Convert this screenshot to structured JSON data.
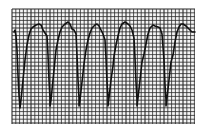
{
  "image": {
    "description": "ECG rhythm strip on grid paper showing wide-complex, sine-wave-like beats",
    "background_color": "#ffffff",
    "grid_color": "#2a2a2a",
    "trace_color": "#111111",
    "grid": {
      "x0": 12,
      "y0": 9,
      "x1": 195,
      "y1": 124,
      "minor": 3.8,
      "major": 19
    },
    "trace_points": [
      [
        14,
        32
      ],
      [
        15,
        30
      ],
      [
        16,
        36
      ],
      [
        17,
        50
      ],
      [
        18,
        75
      ],
      [
        19,
        95
      ],
      [
        20,
        108
      ],
      [
        21,
        100
      ],
      [
        23,
        80
      ],
      [
        25,
        60
      ],
      [
        27,
        45
      ],
      [
        29,
        35
      ],
      [
        31,
        29
      ],
      [
        33,
        27
      ],
      [
        36,
        25
      ],
      [
        39,
        24
      ],
      [
        41,
        25
      ],
      [
        43,
        30
      ],
      [
        45,
        33
      ],
      [
        47,
        36
      ],
      [
        48,
        55
      ],
      [
        49,
        80
      ],
      [
        50,
        98
      ],
      [
        50,
        106
      ],
      [
        51,
        100
      ],
      [
        53,
        80
      ],
      [
        55,
        60
      ],
      [
        56,
        50
      ],
      [
        58,
        40
      ],
      [
        60,
        32
      ],
      [
        62,
        27
      ],
      [
        65,
        24
      ],
      [
        68,
        22
      ],
      [
        70,
        24
      ],
      [
        72,
        29
      ],
      [
        74,
        30
      ],
      [
        76,
        34
      ],
      [
        77,
        55
      ],
      [
        78,
        80
      ],
      [
        79,
        98
      ],
      [
        79,
        106
      ],
      [
        80,
        100
      ],
      [
        82,
        82
      ],
      [
        84,
        64
      ],
      [
        86,
        50
      ],
      [
        88,
        40
      ],
      [
        90,
        33
      ],
      [
        92,
        28
      ],
      [
        95,
        25
      ],
      [
        97,
        24
      ],
      [
        99,
        26
      ],
      [
        101,
        30
      ],
      [
        103,
        34
      ],
      [
        105,
        40
      ],
      [
        106,
        58
      ],
      [
        107,
        82
      ],
      [
        108,
        98
      ],
      [
        108,
        106
      ],
      [
        109,
        98
      ],
      [
        111,
        80
      ],
      [
        113,
        66
      ],
      [
        114,
        56
      ],
      [
        116,
        45
      ],
      [
        118,
        36
      ],
      [
        120,
        28
      ],
      [
        122,
        24
      ],
      [
        125,
        22
      ],
      [
        128,
        24
      ],
      [
        130,
        26
      ],
      [
        132,
        30
      ],
      [
        134,
        38
      ],
      [
        135,
        58
      ],
      [
        136,
        82
      ],
      [
        137,
        100
      ],
      [
        137,
        106
      ],
      [
        138,
        98
      ],
      [
        140,
        80
      ],
      [
        142,
        62
      ],
      [
        144,
        54
      ],
      [
        146,
        44
      ],
      [
        148,
        34
      ],
      [
        150,
        28
      ],
      [
        153,
        25
      ],
      [
        155,
        26
      ],
      [
        158,
        27
      ],
      [
        160,
        28
      ],
      [
        162,
        34
      ],
      [
        164,
        60
      ],
      [
        165,
        85
      ],
      [
        166,
        100
      ],
      [
        166,
        106
      ],
      [
        167,
        98
      ],
      [
        169,
        80
      ],
      [
        171,
        62
      ],
      [
        173,
        55
      ],
      [
        175,
        42
      ],
      [
        177,
        32
      ],
      [
        179,
        27
      ],
      [
        181,
        24
      ],
      [
        183,
        24
      ],
      [
        186,
        26
      ],
      [
        189,
        29
      ],
      [
        192,
        32
      ],
      [
        195,
        32
      ]
    ]
  }
}
